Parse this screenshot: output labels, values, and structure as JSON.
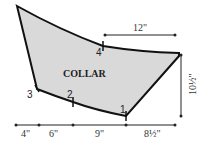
{
  "diagram": {
    "title": "COLLAR",
    "fill_color": "#d9d9d9",
    "stroke_color": "#111111",
    "points": [
      {
        "label": "1"
      },
      {
        "label": "2"
      },
      {
        "label": "3"
      },
      {
        "label": "4"
      }
    ],
    "dimensions": {
      "top": "12\"",
      "right": "10½\"",
      "bottom": [
        "4\"",
        "6\"",
        "9\"",
        "8½\""
      ]
    }
  }
}
